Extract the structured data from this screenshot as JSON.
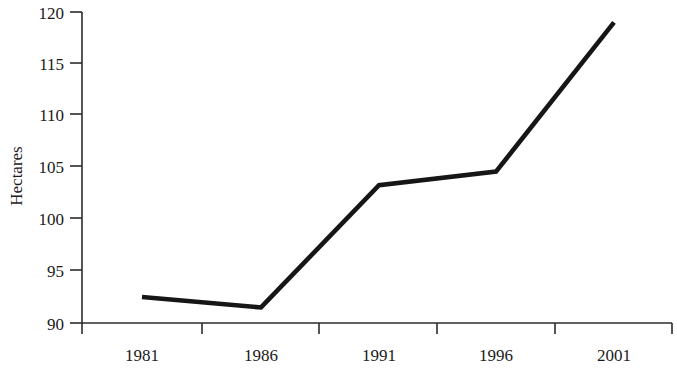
{
  "chart_data": {
    "type": "line",
    "title": "",
    "subtitle": "",
    "xlabel": "",
    "ylabel": "Hectares",
    "categories": [
      "1981",
      "1986",
      "1991",
      "1996",
      "2001"
    ],
    "x": [
      1981,
      1986,
      1991,
      1996,
      2001
    ],
    "values": [
      92.5,
      91.5,
      103.3,
      104.6,
      119.0
    ],
    "series": [
      {
        "name": "Hectares",
        "values": [
          92.5,
          91.5,
          103.3,
          104.6,
          119.0
        ]
      }
    ],
    "ylim": [
      90,
      120
    ],
    "xlim": [
      1981,
      2001
    ],
    "y_ticks": [
      90,
      95,
      100,
      105,
      110,
      115,
      120
    ],
    "y_tick_labels": [
      "90",
      "95",
      "100",
      "105",
      "110",
      "115",
      "120"
    ],
    "x_tick_labels": [
      "1981",
      "1986",
      "1991",
      "1996",
      "2001"
    ],
    "grid": false,
    "legend": false,
    "legend_position": "none",
    "line_color": "#161616",
    "axis_color": "#2b2b2b",
    "background_color": "#ffffff",
    "annotations": []
  },
  "axes": {
    "y_axis_title": "Hectares",
    "x_axis_title": ""
  }
}
